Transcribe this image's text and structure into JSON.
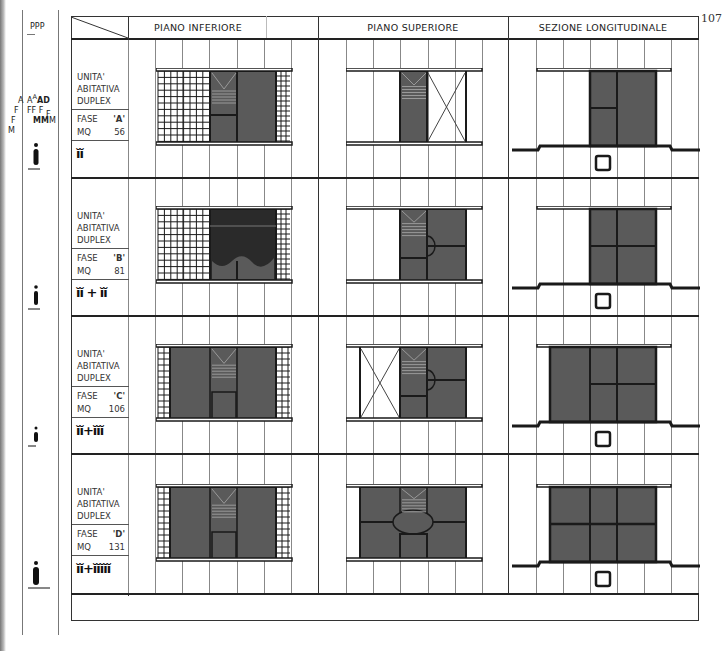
{
  "page_number": "107",
  "columns": {
    "piano_inferiore": "PIANO INFERIORE",
    "piano_superiore": "PIANO SUPERIORE",
    "sezione": "SEZIONE LONGITUDINALE"
  },
  "side_legend": {
    "top": "PPP",
    "letters_a": [
      "A",
      "F",
      "F",
      "M"
    ],
    "letters_b": [
      "A",
      "A",
      "AD",
      "FF",
      "F",
      "F",
      "MM",
      "M",
      "M"
    ]
  },
  "rows": [
    {
      "title_1": "UNITA'",
      "title_2": "ABITATIVA",
      "title_3": "DUPLEX",
      "fase_label": "FASE",
      "fase": "'A'",
      "mq_label": "MQ",
      "mq": "56",
      "occupants": "ĭĭ"
    },
    {
      "title_1": "UNITA'",
      "title_2": "ABITATIVA",
      "title_3": "DUPLEX",
      "fase_label": "FASE",
      "fase": "'B'",
      "mq_label": "MQ",
      "mq": "81",
      "occupants": "ĭĭ + ĭĭ"
    },
    {
      "title_1": "UNITA'",
      "title_2": "ABITATIVA",
      "title_3": "DUPLEX",
      "fase_label": "FASE",
      "fase": "'C'",
      "mq_label": "MQ",
      "mq": "106",
      "occupants": "ĭĭ+ĭĭĭ"
    },
    {
      "title_1": "UNITA'",
      "title_2": "ABITATIVA",
      "title_3": "DUPLEX",
      "fase_label": "FASE",
      "fase": "'D'",
      "mq_label": "MQ",
      "mq": "131",
      "occupants": "ĭĭ+ĭĭĭĭĭ"
    }
  ],
  "colors": {
    "ink": "#1a1a1a",
    "fill": "#555555",
    "dark_fill": "#2a2a2a",
    "grid": "#666666"
  }
}
